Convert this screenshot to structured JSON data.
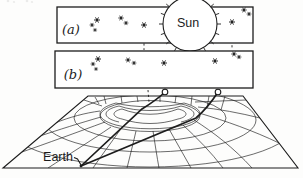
{
  "figure": {
    "title_semantic": "gravitational-lensing-of-starlight-diagram",
    "panel_a": {
      "label": "(a)",
      "box": [
        57,
        7,
        196,
        36
      ],
      "stars": [
        [
          92,
          25,
          0.8
        ],
        [
          97,
          20,
          1
        ],
        [
          95,
          30,
          0.7
        ],
        [
          121,
          18,
          0.9
        ],
        [
          126,
          23,
          0.8
        ],
        [
          144,
          25,
          1
        ],
        [
          232,
          22,
          1
        ],
        [
          244,
          10,
          0.9
        ],
        [
          249,
          14,
          0.8
        ]
      ],
      "dashed_drops": [
        [
          144,
          29,
          144,
          50
        ],
        [
          232,
          26,
          232,
          50
        ]
      ]
    },
    "panel_b": {
      "label": "(b)",
      "box": [
        55,
        51,
        198,
        37
      ],
      "stars": [
        [
          93,
          64,
          0.8
        ],
        [
          98,
          59,
          1
        ],
        [
          96,
          69,
          0.7
        ],
        [
          128,
          60,
          0.9
        ],
        [
          134,
          63,
          0.8
        ],
        [
          164,
          63,
          1
        ],
        [
          215,
          61,
          1
        ],
        [
          234,
          54,
          0.9
        ],
        [
          239,
          57,
          0.8
        ]
      ],
      "dashed_drops": [
        [
          164,
          67,
          165,
          89
        ],
        [
          215,
          65,
          217,
          89
        ],
        [
          148,
          90,
          149,
          102
        ]
      ]
    },
    "sun": {
      "label": "Sun",
      "cx": 190,
      "cy": 24,
      "r": 27,
      "tick_len": 4,
      "tick_step_deg": 20
    },
    "sheet_markers": [
      [
        165,
        92
      ],
      [
        218,
        92
      ]
    ],
    "earth": {
      "label": "Earth",
      "point": [
        81,
        166
      ]
    }
  },
  "icons": {
    "star": "asterisk-star-icon",
    "sun": "sun-circle-icon",
    "marker": "open-circle-marker-icon"
  },
  "colors": {
    "ink": "#1c1c1c",
    "paper": "#fdfdfc"
  }
}
